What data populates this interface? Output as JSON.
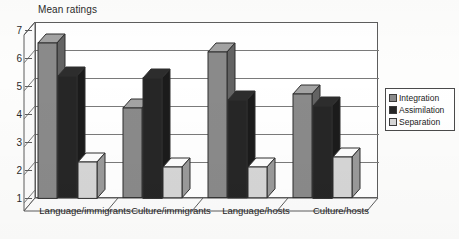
{
  "chart_data": {
    "type": "bar",
    "title": "Mean ratings",
    "xlabel": "",
    "ylabel": "",
    "ylim": [
      1,
      7
    ],
    "yticks": [
      1,
      2,
      3,
      4,
      5,
      6,
      7
    ],
    "ytick_labels": [
      "1",
      "2",
      "3",
      "4",
      "5",
      "6",
      "7"
    ],
    "grid": true,
    "legend_position": "right",
    "three_d": true,
    "categories": [
      "Language/immigrants",
      "Culture/immigrants",
      "Language/hosts",
      "Culture/hosts"
    ],
    "series": [
      {
        "name": "Integration",
        "color": "#8a8a8a",
        "values": [
          6.55,
          4.2,
          6.2,
          4.7
        ]
      },
      {
        "name": "Assimilation",
        "color": "#262626",
        "values": [
          5.35,
          5.3,
          4.5,
          4.3
        ]
      },
      {
        "name": "Separation",
        "color": "#d6d6d6",
        "values": [
          2.3,
          2.1,
          2.1,
          2.45
        ]
      }
    ]
  },
  "legend": {
    "items": [
      {
        "label": "Integration",
        "color": "#8a8a8a"
      },
      {
        "label": "Assimilation",
        "color": "#262626"
      },
      {
        "label": "Separation",
        "color": "#d6d6d6"
      }
    ]
  },
  "axes": {
    "y_min_label": "1",
    "y_max_label": "7"
  }
}
